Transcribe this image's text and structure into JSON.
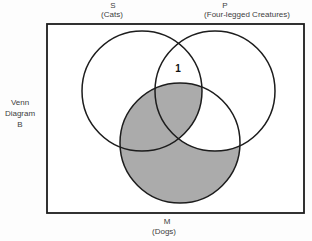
{
  "figure": {
    "caption_lines": [
      "Venn",
      "Diagram",
      "B"
    ],
    "circles": {
      "s": {
        "letter": "S",
        "sublabel": "(Cats)"
      },
      "p": {
        "letter": "P",
        "sublabel": "(Four-legged Creatures)"
      },
      "m": {
        "letter": "M",
        "sublabel": "(Dogs)"
      }
    },
    "annotation": {
      "value": "1"
    },
    "colors": {
      "shade": "#ababab",
      "line": "#1c1c1c",
      "text": "#3d3d3d",
      "background": "#ffffff"
    }
  }
}
